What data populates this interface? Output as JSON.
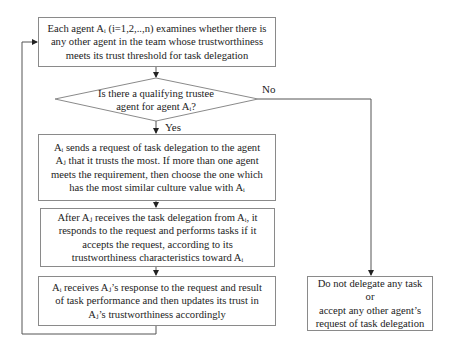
{
  "diagram": {
    "type": "flowchart",
    "nodes": {
      "start": {
        "text": "Each agent Ai (i=1,2,..,n) examines whether there is any other agent in the team whose trustworthiness meets its trust threshold for task delegation",
        "lines": [
          "Each agent Aᵢ (i=1,2,..,n) examines whether there is",
          "any other agent in the team whose trustworthiness",
          "meets its trust threshold for task delegation"
        ]
      },
      "decision": {
        "text": "Is there a qualifying trustee agent for agent Ai?",
        "lines": [
          "Is there a qualifying trustee",
          "agent  for agent Aᵢ?"
        ]
      },
      "send_request": {
        "text": "Ai sends a request of task delegation to the agent Aj that it trusts the most. If more than one agent meets the requirement, then choose the one which has the most similar culture value with Ai",
        "lines": [
          "Aᵢ sends a request of task delegation to the agent",
          "Aⱼ that it trusts the most. If more than one agent",
          "meets the requirement, then choose the one which",
          "has the most similar culture value with Aᵢ"
        ]
      },
      "respond": {
        "text": "After Aj receives the task delegation from Ai, it responds to the request and performs tasks if it accepts the request, according to its trustworthiness characteristics toward Ai",
        "lines": [
          "After Aⱼ receives the task delegation from Aᵢ, it",
          "responds to the request and performs tasks if it",
          "accepts the request, according to its",
          "trustworthiness characteristics toward Aᵢ"
        ]
      },
      "update_trust": {
        "text": "Ai receives Aj's response to the request and result of task performance and then updates its trust in Aj's trustworthiness accordingly",
        "lines": [
          "Aᵢ receives Aⱼ’s response to the request and result",
          "of task performance and then updates its trust in",
          "Aⱼ’s trustworthiness accordingly"
        ]
      },
      "no_delegation": {
        "text": "Do not delegate any task or accept any other agent's request of task delegation",
        "lines": [
          "Do not delegate any task or",
          "accept any other agent’s",
          "request of task delegation"
        ]
      }
    },
    "edge_labels": {
      "yes": "Yes",
      "no": "No"
    },
    "colors": {
      "line": "#555555",
      "border": "#8a8a8a",
      "text": "#222222"
    }
  }
}
